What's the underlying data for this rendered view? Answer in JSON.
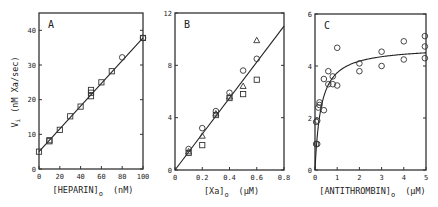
{
  "figure": {
    "ylabel_main": "V",
    "ylabel_sub": "i",
    "ylabel_units": "(nM Xa/sec)"
  },
  "chart_data": [
    {
      "panel": "A",
      "type": "scatter",
      "title": "A",
      "xlabel": "[HEPARIN]",
      "xlabel_sub": "o",
      "xlabel_units": "(nM)",
      "ylabel": "Vi (nM Xa/sec)",
      "xlim": [
        0,
        100
      ],
      "ylim": [
        0,
        45
      ],
      "xticks": [
        0,
        20,
        40,
        60,
        80,
        100
      ],
      "yticks": [
        0,
        10,
        20,
        30,
        40
      ],
      "grid": false,
      "box": {
        "left": 39,
        "top": 13,
        "right": 143,
        "bottom": 169
      },
      "series": [
        {
          "name": "squares",
          "marker": "square",
          "points": [
            [
              0,
              5
            ],
            [
              10,
              8
            ],
            [
              10,
              8.3
            ],
            [
              20,
              11.3
            ],
            [
              30,
              15.2
            ],
            [
              40,
              18
            ],
            [
              50,
              21
            ],
            [
              50,
              22.8
            ],
            [
              50,
              22
            ],
            [
              60,
              25
            ],
            [
              70,
              28.2
            ],
            [
              100,
              37.8
            ]
          ]
        },
        {
          "name": "circles",
          "marker": "circle",
          "points": [
            [
              80,
              32.2
            ],
            [
              100,
              37.8
            ]
          ]
        }
      ],
      "fit": {
        "type": "line",
        "points": [
          [
            0,
            5
          ],
          [
            100,
            37.8
          ]
        ]
      }
    },
    {
      "panel": "B",
      "type": "scatter",
      "title": "B",
      "xlabel": "[Xa]",
      "xlabel_sub": "o",
      "xlabel_units": "(µM)",
      "xlim": [
        0,
        0.8
      ],
      "ylim": [
        0,
        12
      ],
      "xticks": [
        0,
        0.2,
        0.4,
        0.6,
        0.8
      ],
      "xticklabels": [
        "0",
        "0.2",
        "0.4",
        "0.6",
        "0.8"
      ],
      "yticks": [
        0,
        4,
        8,
        12
      ],
      "grid": false,
      "box": {
        "left": 175,
        "top": 13,
        "right": 284,
        "bottom": 170
      },
      "series": [
        {
          "name": "circles",
          "marker": "circle",
          "points": [
            [
              0.1,
              1.6
            ],
            [
              0.2,
              3.2
            ],
            [
              0.3,
              4.5
            ],
            [
              0.4,
              5.9
            ],
            [
              0.5,
              7.6
            ],
            [
              0.6,
              8.5
            ]
          ]
        },
        {
          "name": "triangles",
          "marker": "triangle",
          "points": [
            [
              0.1,
              1.4
            ],
            [
              0.2,
              2.6
            ],
            [
              0.3,
              4.3
            ],
            [
              0.4,
              5.6
            ],
            [
              0.5,
              6.4
            ],
            [
              0.6,
              9.9
            ]
          ]
        },
        {
          "name": "squares",
          "marker": "square",
          "points": [
            [
              0.1,
              1.3
            ],
            [
              0.2,
              1.9
            ],
            [
              0.3,
              4.2
            ],
            [
              0.4,
              5.5
            ],
            [
              0.5,
              5.8
            ],
            [
              0.6,
              6.9
            ]
          ]
        }
      ],
      "fit": {
        "type": "line",
        "points": [
          [
            0,
            0
          ],
          [
            0.8,
            11
          ]
        ]
      }
    },
    {
      "panel": "C",
      "type": "scatter",
      "title": "C",
      "xlabel": "[ANTITHROMBIN]",
      "xlabel_sub": "o",
      "xlabel_units": "(µM)",
      "xlim": [
        0,
        5
      ],
      "ylim": [
        0,
        6
      ],
      "xticks": [
        0,
        1,
        2,
        3,
        4,
        5
      ],
      "yticks": [
        0,
        2,
        4,
        6
      ],
      "grid": false,
      "box": {
        "left": 315,
        "top": 14,
        "right": 426,
        "bottom": 170
      },
      "series": [
        {
          "name": "circles",
          "marker": "circle",
          "points": [
            [
              0.05,
              1.0
            ],
            [
              0.1,
              1.0
            ],
            [
              0.05,
              1.85
            ],
            [
              0.1,
              1.9
            ],
            [
              0.15,
              2.4
            ],
            [
              0.2,
              2.6
            ],
            [
              0.2,
              2.5
            ],
            [
              0.4,
              2.3
            ],
            [
              0.4,
              3.5
            ],
            [
              0.6,
              3.8
            ],
            [
              0.6,
              3.3
            ],
            [
              0.8,
              3.6
            ],
            [
              0.8,
              3.3
            ],
            [
              1.0,
              3.25
            ],
            [
              1.0,
              4.7
            ],
            [
              2.0,
              4.1
            ],
            [
              2.0,
              3.8
            ],
            [
              3.0,
              4.55
            ],
            [
              3.0,
              4.0
            ],
            [
              4.0,
              4.95
            ],
            [
              4.0,
              4.25
            ],
            [
              4.95,
              5.15
            ],
            [
              4.95,
              4.75
            ],
            [
              4.95,
              4.3
            ]
          ]
        }
      ],
      "fit": {
        "type": "hyperbola",
        "vmax": 4.75,
        "km": 0.27,
        "x_range": [
          0.0,
          5.0
        ]
      }
    }
  ]
}
